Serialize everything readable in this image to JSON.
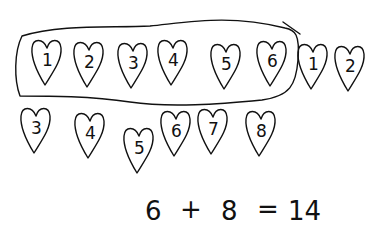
{
  "drawing": {
    "background": "#ffffff",
    "ink": "#111111",
    "group_first": {
      "description": "circled group of six hearts",
      "hearts": [
        {
          "label": "1",
          "x": 47,
          "y": 62
        },
        {
          "label": "2",
          "x": 89,
          "y": 64
        },
        {
          "label": "3",
          "x": 133,
          "y": 65
        },
        {
          "label": "4",
          "x": 173,
          "y": 62
        },
        {
          "label": "5",
          "x": 226,
          "y": 66
        },
        {
          "label": "6",
          "x": 272,
          "y": 63
        }
      ]
    },
    "continuation_top": {
      "hearts": [
        {
          "label": "1",
          "x": 313,
          "y": 66
        },
        {
          "label": "2",
          "x": 350,
          "y": 68
        }
      ]
    },
    "continuation_bottom": {
      "hearts": [
        {
          "label": "3",
          "x": 36,
          "y": 130
        },
        {
          "label": "4",
          "x": 90,
          "y": 135
        },
        {
          "label": "5",
          "x": 139,
          "y": 150
        },
        {
          "label": "6",
          "x": 176,
          "y": 133
        },
        {
          "label": "7",
          "x": 213,
          "y": 131
        },
        {
          "label": "8",
          "x": 261,
          "y": 133
        }
      ]
    },
    "equation": {
      "text": "6 + 8 = 14",
      "left": "6",
      "operator": "+",
      "right": "8",
      "equals": "=",
      "result": "14"
    }
  }
}
